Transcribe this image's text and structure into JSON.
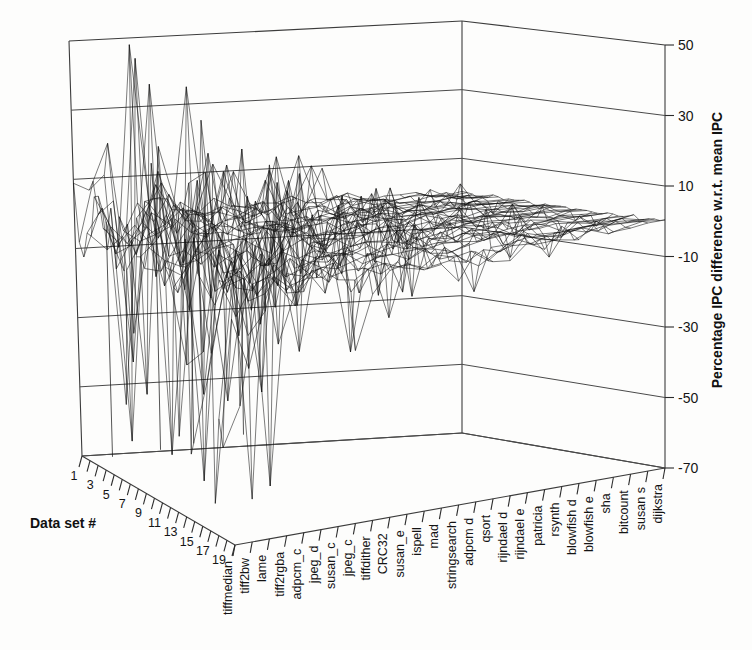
{
  "chart_data": {
    "type": "surface3d",
    "title": "",
    "xlabel": "",
    "ylabel": "Data set #",
    "zlabel": "Percentage IPC difference w.r.t. mean IPC",
    "zticks": [
      "50",
      "30",
      "10",
      "-10",
      "-30",
      "-50",
      "-70"
    ],
    "zlim": [
      -70,
      50
    ],
    "ztick_values": [
      50,
      30,
      10,
      -10,
      -30,
      -50,
      -70
    ],
    "grid": true,
    "legend": "none",
    "y_axis_name": "Data set #",
    "y_categories": [
      "1",
      "3",
      "5",
      "7",
      "9",
      "11",
      "13",
      "15",
      "17",
      "19"
    ],
    "y_tick_values": [
      1,
      3,
      5,
      7,
      9,
      11,
      13,
      15,
      17,
      19
    ],
    "y_minor_count": 20,
    "x_categories": [
      "tiffmedian",
      "tiff2bw",
      "lame",
      "tiff2rgba",
      "adpcm_c",
      "jpeg_d",
      "susan_c",
      "jpeg_c",
      "tiffdither",
      "CRC32",
      "susan_e",
      "ispell",
      "mad",
      "stringsearch",
      "adpcm_d",
      "qsort",
      "rijndael_d",
      "rijndael_e",
      "patricia",
      "rsynth",
      "blowfish_d",
      "blowfish_e",
      "sha",
      "bitcount",
      "susan_s",
      "dijkstra"
    ],
    "x_labels_display": [
      "tiffmedian",
      "tiff2bw",
      "lame",
      "tiff2rgba",
      "adpcm_c",
      "jpeg_d",
      "susan_c",
      "jpeg_c",
      "tiffdither",
      "CRC32",
      "susan_e",
      "ispell",
      "mad",
      "stringsearch",
      "adpcm d",
      "qsort",
      "rijndael d",
      "rijndael e",
      "patricia",
      "rsynth",
      "blowfish d",
      "blowfish e",
      "sha",
      "bitcount",
      "susan s",
      "dijkstra"
    ],
    "series_summary": [
      {
        "benchmark": "tiffmedian",
        "max": 35,
        "min": -68
      },
      {
        "benchmark": "tiff2bw",
        "max": 33,
        "min": -62
      },
      {
        "benchmark": "lame",
        "max": 30,
        "min": -55
      },
      {
        "benchmark": "tiff2rgba",
        "max": 36,
        "min": -70
      },
      {
        "benchmark": "adpcm_c",
        "max": 24,
        "min": -40
      },
      {
        "benchmark": "jpeg_d",
        "max": 22,
        "min": -32
      },
      {
        "benchmark": "susan_c",
        "max": 20,
        "min": -30
      },
      {
        "benchmark": "jpeg_c",
        "max": 18,
        "min": -28
      },
      {
        "benchmark": "tiffdither",
        "max": 16,
        "min": -26
      },
      {
        "benchmark": "CRC32",
        "max": 15,
        "min": -22
      },
      {
        "benchmark": "susan_e",
        "max": 14,
        "min": -20
      },
      {
        "benchmark": "ispell",
        "max": 13,
        "min": -19
      },
      {
        "benchmark": "mad",
        "max": 12,
        "min": -18
      },
      {
        "benchmark": "stringsearch",
        "max": 11,
        "min": -16
      },
      {
        "benchmark": "adpcm_d",
        "max": 10,
        "min": -15
      },
      {
        "benchmark": "qsort",
        "max": 9,
        "min": -13
      },
      {
        "benchmark": "rijndael_d",
        "max": 8,
        "min": -12
      },
      {
        "benchmark": "rijndael_e",
        "max": 7,
        "min": -11
      },
      {
        "benchmark": "patricia",
        "max": 6,
        "min": -10
      },
      {
        "benchmark": "rsynth",
        "max": 6,
        "min": -9
      },
      {
        "benchmark": "blowfish_d",
        "max": 5,
        "min": -8
      },
      {
        "benchmark": "blowfish_e",
        "max": 4,
        "min": -7
      },
      {
        "benchmark": "sha",
        "max": 4,
        "min": -6
      },
      {
        "benchmark": "bitcount",
        "max": 3,
        "min": -5
      },
      {
        "benchmark": "susan_s",
        "max": 2,
        "min": -4
      },
      {
        "benchmark": "dijkstra",
        "max": 2,
        "min": -3
      }
    ]
  },
  "axes": {
    "z_title": "Percentage IPC difference w.r.t. mean IPC",
    "y_title": "Data set #"
  }
}
